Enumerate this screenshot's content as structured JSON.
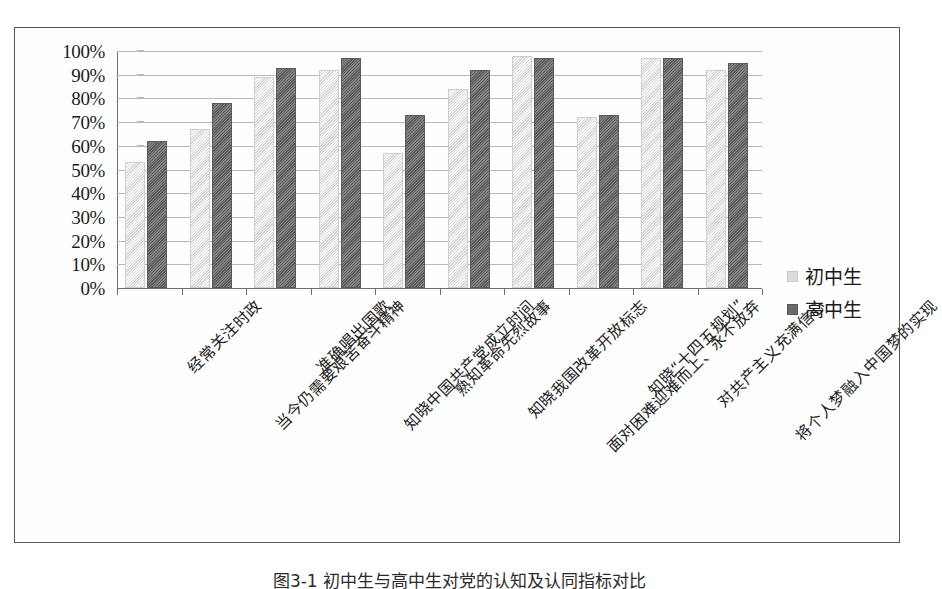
{
  "figure": {
    "caption": "图3-1 初中生与高中生对党的认知及认同指标对比"
  },
  "chart_data": {
    "type": "bar",
    "title": "",
    "subtitle": "",
    "xlabel": "",
    "ylabel": "",
    "ylim": [
      0,
      100
    ],
    "y_tick_labels": [
      "100%",
      "90%",
      "80%",
      "70%",
      "60%",
      "50%",
      "40%",
      "30%",
      "20%",
      "10%",
      "0%"
    ],
    "y_tick_values": [
      100,
      90,
      80,
      70,
      60,
      50,
      40,
      30,
      20,
      10,
      0
    ],
    "grid": true,
    "legend_position": "right",
    "categories": [
      "经常关注时政",
      "当今仍需要艰苦奋斗精神",
      "准确唱出国歌",
      "知晓中国共产党成立时间",
      "熟知革命先烈故事",
      "知晓我国改革开放标志",
      "面对困难迎难而上、永不放弃",
      "知晓“十四五规划”",
      "对共产主义充满信心",
      "将个人梦融入中国梦的实现"
    ],
    "series": [
      {
        "name": "初中生",
        "color": "#dcdcdc",
        "values": [
          53,
          67,
          89,
          92,
          57,
          84,
          98,
          72,
          97,
          92
        ]
      },
      {
        "name": "高中生",
        "color": "#6a6a6a",
        "values": [
          62,
          78,
          93,
          97,
          73,
          92,
          97,
          73,
          97,
          95
        ]
      }
    ]
  }
}
